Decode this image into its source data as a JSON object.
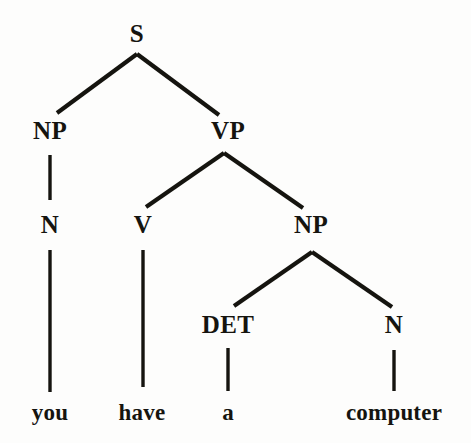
{
  "figure": {
    "kind": "syntax-parse-tree",
    "sentence": "you have a computer",
    "background_color": "#fdfdfc",
    "ink_color": "#15140f"
  },
  "nodes": {
    "s": {
      "label": "S",
      "x": 137,
      "y": 42
    },
    "np1": {
      "label": "NP",
      "x": 50,
      "y": 139
    },
    "vp": {
      "label": "VP",
      "x": 228,
      "y": 139
    },
    "n1": {
      "label": "N",
      "x": 50,
      "y": 233
    },
    "v": {
      "label": "V",
      "x": 143,
      "y": 233
    },
    "np2": {
      "label": "NP",
      "x": 311,
      "y": 233
    },
    "det": {
      "label": "DET",
      "x": 228,
      "y": 333
    },
    "n2": {
      "label": "N",
      "x": 394,
      "y": 333
    }
  },
  "words": {
    "you": {
      "label": "you",
      "x": 50,
      "y": 420
    },
    "have": {
      "label": "have",
      "x": 142,
      "y": 420
    },
    "a": {
      "label": "a",
      "x": 228,
      "y": 420
    },
    "computer": {
      "label": "computer",
      "x": 394,
      "y": 420
    }
  },
  "edges": [
    {
      "name": "s-to-np",
      "from": "S",
      "to": "NP",
      "x1": 137,
      "y1": 54,
      "x2": 57,
      "y2": 113
    },
    {
      "name": "s-to-vp",
      "from": "S",
      "to": "VP",
      "x1": 137,
      "y1": 54,
      "x2": 219,
      "y2": 115
    },
    {
      "name": "np-to-n",
      "from": "NP",
      "to": "N",
      "x1": 50,
      "y1": 155,
      "x2": 50,
      "y2": 200
    },
    {
      "name": "vp-to-v",
      "from": "VP",
      "to": "V",
      "x1": 224,
      "y1": 153,
      "x2": 146,
      "y2": 207
    },
    {
      "name": "vp-to-np",
      "from": "VP",
      "to": "NP",
      "x1": 224,
      "y1": 153,
      "x2": 303,
      "y2": 208
    },
    {
      "name": "n-to-you",
      "from": "N",
      "to": "you",
      "x1": 50,
      "y1": 250,
      "x2": 50,
      "y2": 392
    },
    {
      "name": "v-to-have",
      "from": "V",
      "to": "have",
      "x1": 143,
      "y1": 250,
      "x2": 143,
      "y2": 387
    },
    {
      "name": "np2-to-det",
      "from": "NP",
      "to": "DET",
      "x1": 312,
      "y1": 252,
      "x2": 234,
      "y2": 306
    },
    {
      "name": "np2-to-n",
      "from": "NP",
      "to": "N",
      "x1": 312,
      "y1": 252,
      "x2": 392,
      "y2": 307
    },
    {
      "name": "det-to-a",
      "from": "DET",
      "to": "a",
      "x1": 228,
      "y1": 348,
      "x2": 228,
      "y2": 391
    },
    {
      "name": "n2-to-computer",
      "from": "N",
      "to": "computer",
      "x1": 394,
      "y1": 350,
      "x2": 394,
      "y2": 391
    }
  ],
  "tree_structure": {
    "label": "S",
    "children": [
      {
        "label": "NP",
        "children": [
          {
            "label": "N",
            "children": [
              {
                "label": "you",
                "terminal": true
              }
            ]
          }
        ]
      },
      {
        "label": "VP",
        "children": [
          {
            "label": "V",
            "children": [
              {
                "label": "have",
                "terminal": true
              }
            ]
          },
          {
            "label": "NP",
            "children": [
              {
                "label": "DET",
                "children": [
                  {
                    "label": "a",
                    "terminal": true
                  }
                ]
              },
              {
                "label": "N",
                "children": [
                  {
                    "label": "computer",
                    "terminal": true
                  }
                ]
              }
            ]
          }
        ]
      }
    ]
  }
}
